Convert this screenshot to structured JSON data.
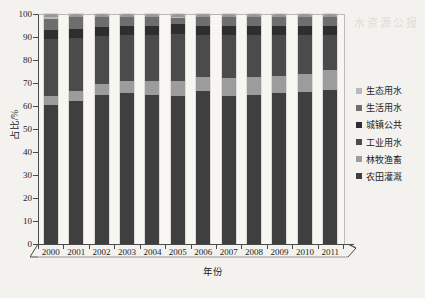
{
  "chart_data": {
    "type": "bar",
    "subtype": "stacked-bar-100",
    "title": "",
    "xlabel": "年份",
    "ylabel": "占比/%",
    "ylim": [
      0,
      100
    ],
    "yticks": [
      0,
      10,
      20,
      30,
      40,
      50,
      60,
      70,
      80,
      90,
      100
    ],
    "grid": false,
    "legend_position": "right",
    "categories": [
      "2000",
      "2001",
      "2002",
      "2003",
      "2004",
      "2005",
      "2006",
      "2007",
      "2008",
      "2009",
      "2010",
      "2011"
    ],
    "series": [
      {
        "name": "农田灌溉",
        "color": "#3f3f3f",
        "values": [
          60.5,
          62.0,
          65.0,
          65.5,
          65.0,
          64.5,
          66.5,
          64.5,
          65.0,
          65.5,
          66.0,
          67.0
        ]
      },
      {
        "name": "林牧渔畜",
        "color": "#9c9c9c",
        "values": [
          4.0,
          4.5,
          4.5,
          5.5,
          6.0,
          6.5,
          6.0,
          7.5,
          7.5,
          7.5,
          8.0,
          8.5
        ]
      },
      {
        "name": "工业用水",
        "color": "#4b4b4b",
        "values": [
          24.5,
          23.0,
          21.0,
          20.0,
          20.0,
          20.5,
          18.5,
          19.0,
          18.5,
          18.0,
          17.0,
          15.5
        ]
      },
      {
        "name": "城镇公共",
        "color": "#2e2e2e",
        "values": [
          4.0,
          4.0,
          4.0,
          4.0,
          4.0,
          4.0,
          4.0,
          4.0,
          4.0,
          4.0,
          4.0,
          4.0
        ]
      },
      {
        "name": "生活用水",
        "color": "#6e6e6e",
        "values": [
          5.0,
          5.0,
          4.0,
          3.5,
          3.5,
          3.0,
          3.5,
          3.5,
          3.5,
          3.5,
          3.5,
          3.5
        ]
      },
      {
        "name": "生态用水",
        "color": "#b9b9b9",
        "values": [
          2.0,
          1.5,
          1.5,
          1.5,
          1.5,
          1.5,
          1.5,
          1.5,
          1.5,
          1.5,
          1.5,
          1.5
        ]
      }
    ]
  },
  "legend": {
    "items": [
      {
        "label": "生态用水",
        "color": "#b9b9b9"
      },
      {
        "label": "生活用水",
        "color": "#6e6e6e"
      },
      {
        "label": "城镇公共",
        "color": "#2e2e2e"
      },
      {
        "label": "工业用水",
        "color": "#4b4b4b"
      },
      {
        "label": "林牧渔畜",
        "color": "#9c9c9c"
      },
      {
        "label": "农田灌溉",
        "color": "#3f3f3f"
      }
    ]
  },
  "ghost_text": "水资源公报"
}
